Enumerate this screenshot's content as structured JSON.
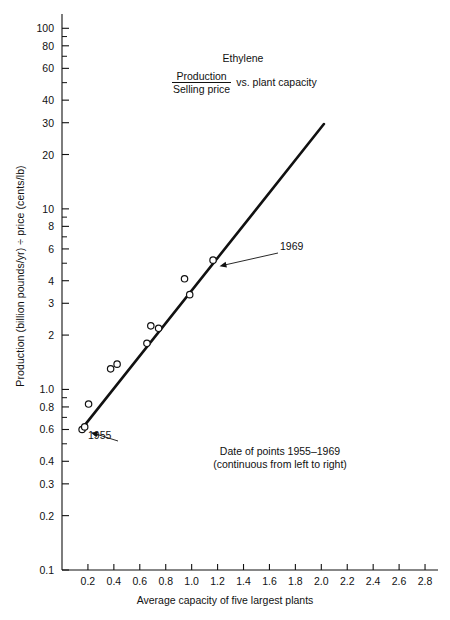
{
  "chart_data": {
    "type": "scatter",
    "title": "Ethylene",
    "title_ratio_numerator": "Production",
    "title_ratio_denominator": "Selling price",
    "title_suffix": "vs. plant capacity",
    "xlabel": "Average capacity of five largest plants",
    "ylabel": "Production (billion pounds/yr) ÷ price (cents/lb)",
    "grid": false,
    "legend": "none",
    "xscale": "linear",
    "yscale": "log",
    "xlim": [
      0.0,
      2.9
    ],
    "ylim": [
      0.1,
      120
    ],
    "xticks": [
      0.2,
      0.4,
      0.6,
      0.8,
      1.0,
      1.2,
      1.4,
      1.6,
      1.8,
      2.0,
      2.2,
      2.4,
      2.6,
      2.8
    ],
    "xticklabels": [
      "0.2",
      "0.4",
      "0.6",
      "0.8",
      "1.0",
      "1.2",
      "1.4",
      "1.6",
      "1.8",
      "2.0",
      "2.2",
      "2.4",
      "2.6",
      "2.8"
    ],
    "yticks": [
      100,
      80,
      60,
      40,
      30,
      20,
      10,
      8,
      6,
      4,
      3,
      2,
      1.0,
      0.8,
      0.6,
      0.4,
      0.3,
      0.2,
      0.1
    ],
    "yticklabels": [
      "100",
      "80",
      "60",
      "40",
      "30",
      "20",
      "10",
      "8",
      "6",
      "4",
      "3",
      "2",
      "1.0",
      "0.8",
      "0.6",
      "0.4",
      "0.3",
      "0.2",
      "0.1"
    ],
    "yminorticks": [
      90,
      70,
      50,
      9,
      7,
      5,
      0.9,
      0.7,
      0.5
    ],
    "series": [
      {
        "name": "Ethylene plants 1955-1969",
        "marker": "open-circle",
        "points": [
          {
            "x": 0.155,
            "y": 0.6
          },
          {
            "x": 0.175,
            "y": 0.62
          },
          {
            "x": 0.205,
            "y": 0.83
          },
          {
            "x": 0.375,
            "y": 1.3
          },
          {
            "x": 0.425,
            "y": 1.38
          },
          {
            "x": 0.655,
            "y": 1.8
          },
          {
            "x": 0.685,
            "y": 2.25
          },
          {
            "x": 0.745,
            "y": 2.18
          },
          {
            "x": 0.945,
            "y": 4.1
          },
          {
            "x": 0.985,
            "y": 3.35
          },
          {
            "x": 1.165,
            "y": 5.2
          }
        ]
      }
    ],
    "trendline": {
      "x0": 0.145,
      "y0": 0.595,
      "x1": 2.02,
      "y1": 29.5
    },
    "annotations": [
      {
        "label": "1969",
        "x": 1.165,
        "y": 5.2
      },
      {
        "label": "1955",
        "x": 0.175,
        "y": 0.62
      }
    ],
    "note_line1": "Date of points 1955–1969",
    "note_line2": "(continuous from left to right)"
  },
  "colors": {
    "ink": "#111111",
    "axis": "#111111",
    "background": "#ffffff",
    "marker_stroke": "#111111",
    "marker_fill": "#ffffff"
  }
}
